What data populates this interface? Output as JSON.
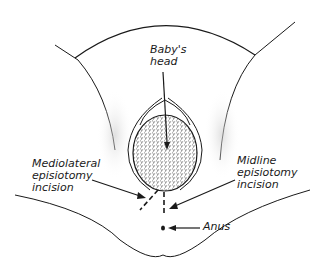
{
  "diagram": {
    "labels": {
      "babys_head": "Baby's\nhead",
      "mediolateral": "Mediolateral\nepisiotomy\nincision",
      "midline": "Midline\nepisiotomy\nincision",
      "anus": "Anus"
    },
    "colors": {
      "line": "#1a1a1a",
      "shade": "#bdbdbd",
      "background": "#ffffff"
    }
  }
}
